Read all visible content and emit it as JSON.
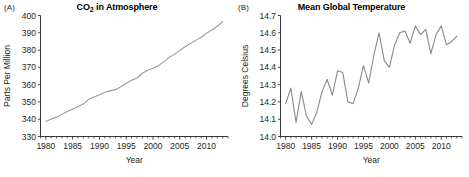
{
  "figure": {
    "panels": [
      {
        "letter": "(A)",
        "title_main": "CO",
        "title_sub": "2",
        "title_tail": " in Atmosphere"
      },
      {
        "letter": "(B)",
        "title_main": "Mean Global Temperature",
        "title_sub": "",
        "title_tail": ""
      }
    ]
  },
  "style": {
    "line_color": "#9a9a9a",
    "line_color_b": "#8a8a8a",
    "axis_color": "#231f20",
    "background": "#ffffff"
  },
  "chart_data": [
    {
      "type": "line",
      "title": "CO2 in Atmosphere",
      "panel": "(A)",
      "xlabel": "Year",
      "ylabel": "Parts Per Million",
      "xlim": [
        1979,
        2014
      ],
      "ylim": [
        330,
        400
      ],
      "xticks": [
        1980,
        1985,
        1990,
        1995,
        2000,
        2005,
        2010
      ],
      "xtick_labels": [
        "1980",
        "1985",
        "1990",
        "1995",
        "2000",
        "2005",
        "2010"
      ],
      "yticks": [
        330,
        340,
        350,
        360,
        370,
        380,
        390,
        400
      ],
      "ytick_labels": [
        "330",
        "340",
        "350",
        "360",
        "370",
        "380",
        "390",
        "400"
      ],
      "minor_xtick_step": 1,
      "grid": false,
      "legend": "none",
      "x": [
        1980,
        1981,
        1982,
        1983,
        1984,
        1985,
        1986,
        1987,
        1988,
        1989,
        1990,
        1991,
        1992,
        1993,
        1994,
        1995,
        1996,
        1997,
        1998,
        1999,
        2000,
        2001,
        2002,
        2003,
        2004,
        2005,
        2006,
        2007,
        2008,
        2009,
        2010,
        2011,
        2012,
        2013
      ],
      "values": [
        338.7,
        340.1,
        341.2,
        342.8,
        344.4,
        345.9,
        347.2,
        348.9,
        351.5,
        352.9,
        354.2,
        355.6,
        356.4,
        357.1,
        358.8,
        360.8,
        362.6,
        363.7,
        366.6,
        368.3,
        369.5,
        371.0,
        373.2,
        375.8,
        377.5,
        379.8,
        381.9,
        383.8,
        385.6,
        387.4,
        389.8,
        391.6,
        393.8,
        396.5
      ]
    },
    {
      "type": "line",
      "title": "Mean Global Temperature",
      "panel": "(B)",
      "xlabel": "Year",
      "ylabel": "Degrees Celsius",
      "xlim": [
        1979,
        2014
      ],
      "ylim": [
        14.0,
        14.7
      ],
      "xticks": [
        1980,
        1985,
        1990,
        1995,
        2000,
        2005,
        2010
      ],
      "xtick_labels": [
        "1980",
        "1985",
        "1990",
        "1995",
        "2000",
        "2005",
        "2010"
      ],
      "yticks": [
        14.0,
        14.1,
        14.2,
        14.3,
        14.4,
        14.5,
        14.6,
        14.7
      ],
      "ytick_labels": [
        "14.0",
        "14.1",
        "14.2",
        "14.3",
        "14.4",
        "14.5",
        "14.6",
        "14.7"
      ],
      "minor_xtick_step": 1,
      "grid": false,
      "legend": "none",
      "x": [
        1980,
        1981,
        1982,
        1983,
        1984,
        1985,
        1986,
        1987,
        1988,
        1989,
        1990,
        1991,
        1992,
        1993,
        1994,
        1995,
        1996,
        1997,
        1998,
        1999,
        2000,
        2001,
        2002,
        2003,
        2004,
        2005,
        2006,
        2007,
        2008,
        2009,
        2010,
        2011,
        2012,
        2013
      ],
      "values": [
        14.19,
        14.28,
        14.08,
        14.26,
        14.12,
        14.07,
        14.14,
        14.26,
        14.33,
        14.24,
        14.38,
        14.37,
        14.2,
        14.19,
        14.28,
        14.41,
        14.31,
        14.47,
        14.6,
        14.44,
        14.4,
        14.53,
        14.6,
        14.61,
        14.54,
        14.64,
        14.59,
        14.62,
        14.48,
        14.59,
        14.64,
        14.53,
        14.55,
        14.58
      ]
    }
  ]
}
